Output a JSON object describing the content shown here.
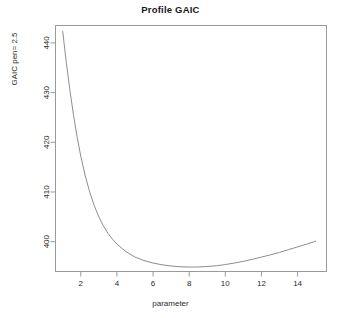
{
  "chart_data": {
    "type": "line",
    "title": "Profile GAIC",
    "xlabel": "parameter",
    "ylabel": "GAIC pen= 2.5",
    "xlim": [
      0.6,
      15.6
    ],
    "ylim": [
      394.0,
      443.5
    ],
    "grid": false,
    "legend": null,
    "xticks": [
      2,
      4,
      6,
      8,
      10,
      12,
      14
    ],
    "yticks": [
      400,
      410,
      420,
      430,
      440
    ],
    "line_color": "#808080",
    "series": [
      {
        "name": "GAIC profile",
        "x": [
          1.0,
          1.2,
          1.4,
          1.6,
          1.8,
          2.0,
          2.25,
          2.5,
          2.75,
          3.0,
          3.25,
          3.5,
          3.75,
          4.0,
          4.5,
          5.0,
          5.5,
          6.0,
          6.5,
          7.0,
          7.5,
          8.0,
          8.25,
          8.5,
          9.0,
          9.5,
          10.0,
          10.5,
          11.0,
          11.5,
          12.0,
          12.5,
          13.0,
          13.5,
          14.0,
          14.5,
          15.0
        ],
        "y": [
          442.3,
          436.0,
          430.4,
          425.4,
          421.0,
          417.2,
          413.2,
          409.9,
          407.2,
          405.0,
          403.2,
          401.7,
          400.5,
          399.5,
          398.0,
          396.9,
          396.2,
          395.7,
          395.35,
          395.1,
          394.95,
          394.9,
          394.9,
          394.92,
          395.0,
          395.15,
          395.4,
          395.7,
          396.05,
          396.45,
          396.9,
          397.35,
          397.85,
          398.4,
          398.95,
          399.5,
          400.1
        ]
      }
    ],
    "minimum": {
      "x": 8.2,
      "y": 394.9
    }
  }
}
